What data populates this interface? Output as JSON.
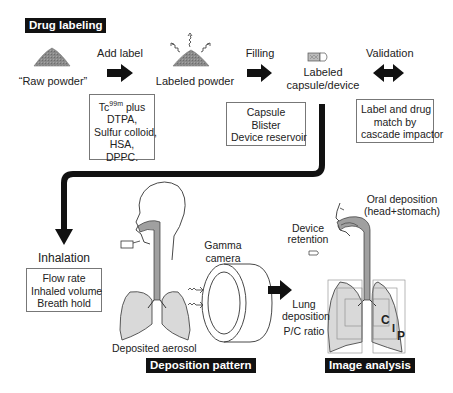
{
  "sections": {
    "drug_labeling": "Drug labeling",
    "deposition_pattern": "Deposition pattern",
    "image_analysis": "Image analysis"
  },
  "steps": {
    "raw_powder": "“Raw powder”",
    "add_label": "Add label",
    "labeled_powder": "Labeled powder",
    "filling": "Filling",
    "labeled_device_line1": "Labeled",
    "labeled_device_line2": "capsule/device",
    "validation": "Validation",
    "inhalation": "Inhalation"
  },
  "boxes": {
    "label_agents": {
      "tc_prefix": "Tc",
      "tc_sup": "99m",
      "tc_suffix": " plus",
      "lines": [
        "DTPA,",
        "Sulfur colloid,",
        "HSA,",
        "DPPC."
      ]
    },
    "filling_options": [
      "Capsule",
      "Blister",
      "Device reservoir"
    ],
    "validation_method": [
      "Label and drug",
      "match by",
      "cascade impactor"
    ],
    "inhalation_params": [
      "Flow rate",
      "Inhaled volume",
      "Breath hold"
    ]
  },
  "deposition": {
    "gamma_camera_line1": "Gamma",
    "gamma_camera_line2": "camera",
    "deposited_aerosol": "Deposited aerosol"
  },
  "analysis": {
    "oral_deposition_line1": "Oral deposition",
    "oral_deposition_line2": "(head+stomach)",
    "device_retention_line1": "Device",
    "device_retention_line2": "retention",
    "lung_deposition_line1": "Lung",
    "lung_deposition_line2": "deposition",
    "pc_ratio": "P/C ratio",
    "regions": {
      "central": "C",
      "intermediate": "I",
      "peripheral": "P"
    }
  },
  "colors": {
    "powder": "#8a8a8a",
    "lung_fill": "#d9d9d9",
    "airway_fill": "#a0a0a0",
    "arrow": "#111111",
    "tag_bg": "#111111"
  }
}
